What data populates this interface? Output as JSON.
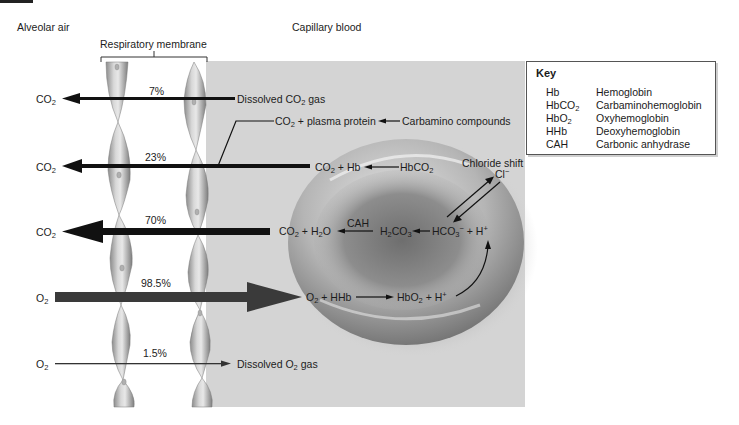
{
  "regions": {
    "alveolar_air": "Alveolar air",
    "capillary_blood": "Capillary blood",
    "respiratory_membrane": "Respiratory membrane"
  },
  "pathways": [
    {
      "id": "co2-dissolved",
      "left_label": "CO",
      "left_sub": "2",
      "percent": "7%",
      "direction": "left",
      "right_label_pre": "Dissolved CO",
      "right_label_sub": "2",
      "right_label_post": " gas"
    },
    {
      "id": "co2-carbamino",
      "left_label": "CO",
      "left_sub": "2",
      "percent": "23%",
      "direction": "left"
    },
    {
      "id": "co2-bicarbonate",
      "left_label": "CO",
      "left_sub": "2",
      "percent": "70%",
      "direction": "left"
    },
    {
      "id": "o2-hemoglobin",
      "left_label": "O",
      "left_sub": "2",
      "percent": "98.5%",
      "direction": "right"
    },
    {
      "id": "o2-dissolved",
      "left_label": "O",
      "left_sub": "2",
      "percent": "1.5%",
      "direction": "right",
      "right_label_pre": "Dissolved O",
      "right_label_sub": "2",
      "right_label_post": " gas"
    }
  ],
  "reactions": {
    "plasma_protein": {
      "co2": "CO",
      "sub": "2",
      "rest": " + plasma protein"
    },
    "carbamino": "Carbamino compounds",
    "co2_hb": {
      "co2": "CO",
      "sub": "2",
      "rest": " + Hb"
    },
    "hbco2": {
      "pre": "HbCO",
      "sub": "2"
    },
    "chloride_shift": "Chloride shift",
    "cl_ion": {
      "base": "Cl",
      "sup": "−"
    },
    "co2_h2o": {
      "co2": "CO",
      "sub1": "2",
      "mid": " + H",
      "sub2": "2",
      "end": "O"
    },
    "cah": "CAH",
    "h2co3": {
      "h": "H",
      "sub1": "2",
      "co": "CO",
      "sub2": "3"
    },
    "hco3_h": {
      "pre": "HCO",
      "sub": "3",
      "sup1": "−",
      "mid": " + H",
      "sup2": "+"
    },
    "o2_hhb": {
      "o": "O",
      "sub": "2",
      "rest": " + HHb"
    },
    "hbo2_h": {
      "pre": "HbO",
      "sub": "2",
      "mid": " + H",
      "sup": "+"
    }
  },
  "key": {
    "title": "Key",
    "entries": [
      {
        "abbr": "Hb",
        "sub": "",
        "definition": "Hemoglobin"
      },
      {
        "abbr": "HbCO",
        "sub": "2",
        "definition": "Carbaminohemoglobin"
      },
      {
        "abbr": "HbO",
        "sub": "2",
        "definition": "Oxyhemoglobin"
      },
      {
        "abbr": "HHb",
        "sub": "",
        "definition": "Deoxyhemoglobin"
      },
      {
        "abbr": "CAH",
        "sub": "",
        "definition": "Carbonic anhydrase"
      }
    ]
  },
  "colors": {
    "capillary_bg": "#d4d4d4",
    "rbc_light": "#d9d9d9",
    "rbc_dark": "#7a7a7a",
    "arrow_dark": "#111111",
    "arrow_o2": "#3a3a3a",
    "membrane_cell": "#9a9a9a"
  }
}
